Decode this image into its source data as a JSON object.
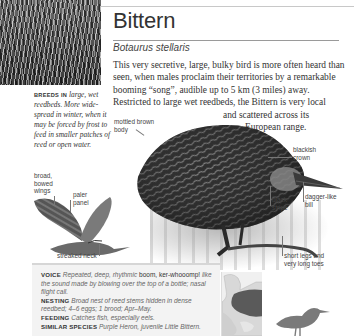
{
  "species": {
    "common_name": "Bittern",
    "latin_name": "Botaurus stellaris"
  },
  "description": {
    "lines": [
      "This very secretive, large, bulky bird is more often heard than",
      "seen, when males proclaim their territories by a remarkable",
      "booming “song”, audible up to 5 km (3 miles) away.",
      "Restricted to large wet reedbeds, the Bittern is very local",
      "and scattered across its",
      "European range."
    ]
  },
  "habitat": {
    "lead": "BREEDS IN",
    "lines": [
      "large, wet",
      "reedbeds. More wide-",
      "spread in winter, when",
      "it may be forced by",
      "frost to feed in smaller",
      "patches of reed or",
      "open water."
    ]
  },
  "annotations": {
    "mottled_body": [
      "mottled brown",
      "body"
    ],
    "blackish_crown": [
      "blackish",
      "crown"
    ],
    "dagger_bill": [
      "dagger-like",
      "bill"
    ],
    "black_stripe": [
      "black",
      "stripe"
    ],
    "legs_toes": [
      "short legs and",
      "very long toes"
    ],
    "broad_wings": [
      "broad,",
      "bowed",
      "wings"
    ],
    "paler_panel": [
      "paler",
      "panel"
    ],
    "streaked_neck": "streaked neck"
  },
  "info": {
    "voice": {
      "key": "VOICE",
      "text1": "Repeated, deep, rhythmic",
      "strong": "boom, ker-whooomp!",
      "text2": "like the sound made by blowing over the top of a bottle; nasal flight call."
    },
    "nesting": {
      "key": "NESTING",
      "text": "Broad nest of reed stems hidden in dense reedbed; 4–6 eggs; 1 brood; Apr–May."
    },
    "feeding": {
      "key": "FEEDING",
      "text": "Catches fish, especially eels."
    },
    "similar": {
      "key": "SIMILAR SPECIES",
      "text": "Purple Heron, juvenile Little Bittern."
    }
  },
  "colors": {
    "text": "#333333",
    "rule": "#9a9a9a",
    "info_bg": "#f3f3f3",
    "range_fill": "#5a5a5a",
    "silhouette": "#7a7a7a"
  }
}
